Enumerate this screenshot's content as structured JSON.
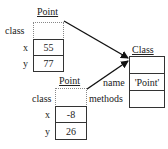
{
  "objects": {
    "point1": {
      "title": "Point",
      "fields": [
        {
          "name": "class",
          "value": ""
        },
        {
          "name": "x",
          "value": "55"
        },
        {
          "name": "y",
          "value": "77"
        }
      ]
    },
    "point2": {
      "title": "Point",
      "fields": [
        {
          "name": "class",
          "value": ""
        },
        {
          "name": "x",
          "value": "-8"
        },
        {
          "name": "y",
          "value": "26"
        }
      ]
    },
    "class_obj": {
      "title": "Class",
      "fields": [
        {
          "name": "",
          "value": ""
        },
        {
          "name": "name",
          "value": "'Point'"
        },
        {
          "name": "methods",
          "value": ""
        }
      ]
    }
  },
  "arrows": [
    {
      "from": "point1.class",
      "to": "class_obj"
    },
    {
      "from": "point2.class",
      "to": "class_obj"
    }
  ]
}
